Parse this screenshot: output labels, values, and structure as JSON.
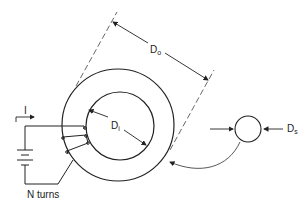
{
  "diagram": {
    "labels": {
      "outer_diameter": "D",
      "outer_diameter_sub": "o",
      "inner_diameter": "D",
      "inner_diameter_sub": "i",
      "cross_section_diameter": "D",
      "cross_section_diameter_sub": "s",
      "current": "I",
      "turns": "N turns"
    },
    "colors": {
      "line": "#222222",
      "dashed": "#555555",
      "background": "#ffffff"
    }
  }
}
